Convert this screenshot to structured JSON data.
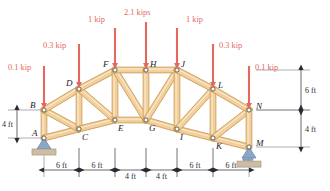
{
  "diagram": {
    "colors": {
      "member_fill": "#f2cf9b",
      "member_edge": "#c99a52",
      "load_red": "#e4685f",
      "dim_gray": "#2a2a33",
      "support_blue": "#8aa6c8",
      "support_ground": "#cdbda4"
    },
    "joints": [
      {
        "id": "A",
        "label": "A",
        "x": 44,
        "y": 138,
        "lx": 32,
        "ly": 136
      },
      {
        "id": "B",
        "label": "B",
        "x": 44,
        "y": 110,
        "lx": 30,
        "ly": 108
      },
      {
        "id": "C",
        "label": "C",
        "x": 79,
        "y": 129,
        "lx": 82,
        "ly": 140
      },
      {
        "id": "D",
        "label": "D",
        "x": 79,
        "y": 89,
        "lx": 66,
        "ly": 86
      },
      {
        "id": "E",
        "label": "E",
        "x": 115,
        "y": 120,
        "lx": 118,
        "ly": 131
      },
      {
        "id": "F",
        "label": "F",
        "x": 115,
        "y": 70,
        "lx": 103,
        "ly": 67
      },
      {
        "id": "G",
        "label": "G",
        "x": 146,
        "y": 120,
        "lx": 149,
        "ly": 131
      },
      {
        "id": "H",
        "label": "H",
        "x": 146,
        "y": 70,
        "lx": 150,
        "ly": 67
      },
      {
        "id": "I",
        "label": "I",
        "x": 177,
        "y": 129,
        "lx": 180,
        "ly": 140
      },
      {
        "id": "J",
        "label": "J",
        "x": 177,
        "y": 70,
        "lx": 181,
        "ly": 67
      },
      {
        "id": "K",
        "label": "K",
        "x": 213,
        "y": 138,
        "lx": 216,
        "ly": 149
      },
      {
        "id": "L",
        "label": "L",
        "x": 213,
        "y": 89,
        "lx": 218,
        "ly": 88
      },
      {
        "id": "M",
        "label": "M",
        "x": 249,
        "y": 147,
        "lx": 256,
        "ly": 146
      },
      {
        "id": "N",
        "label": "N",
        "x": 249,
        "y": 110,
        "lx": 256,
        "ly": 109
      }
    ],
    "members": [
      [
        "A",
        "B"
      ],
      [
        "A",
        "C"
      ],
      [
        "B",
        "C"
      ],
      [
        "B",
        "D"
      ],
      [
        "C",
        "D"
      ],
      [
        "C",
        "E"
      ],
      [
        "D",
        "E"
      ],
      [
        "D",
        "F"
      ],
      [
        "E",
        "F"
      ],
      [
        "E",
        "G"
      ],
      [
        "F",
        "G"
      ],
      [
        "F",
        "H"
      ],
      [
        "G",
        "H"
      ],
      [
        "G",
        "I"
      ],
      [
        "G",
        "J"
      ],
      [
        "H",
        "J"
      ],
      [
        "I",
        "J"
      ],
      [
        "I",
        "K"
      ],
      [
        "I",
        "L"
      ],
      [
        "J",
        "L"
      ],
      [
        "K",
        "L"
      ],
      [
        "K",
        "M"
      ],
      [
        "K",
        "N"
      ],
      [
        "L",
        "N"
      ],
      [
        "M",
        "N"
      ]
    ],
    "loads": [
      {
        "joint": "B",
        "magnitude": "0.1 kip",
        "x": 44,
        "tail_y": 66,
        "head_y": 106,
        "tx": 8,
        "ty": 70
      },
      {
        "joint": "D",
        "magnitude": "0.3 kip",
        "x": 79,
        "tail_y": 44,
        "head_y": 85,
        "tx": 43,
        "ty": 48
      },
      {
        "joint": "F",
        "magnitude": "1 kip",
        "x": 115,
        "tail_y": 28,
        "head_y": 66,
        "tx": 88,
        "ty": 22
      },
      {
        "joint": "H",
        "magnitude": "2.1 kips",
        "x": 146,
        "tail_y": 22,
        "head_y": 66,
        "tx": 124,
        "ty": 15
      },
      {
        "joint": "J",
        "magnitude": "1 kip",
        "x": 177,
        "tail_y": 28,
        "head_y": 66,
        "tx": 186,
        "ty": 22
      },
      {
        "joint": "L",
        "magnitude": "0.3 kip",
        "x": 213,
        "tail_y": 44,
        "head_y": 85,
        "tx": 219,
        "ty": 48
      },
      {
        "joint": "N",
        "magnitude": "0.1 kip",
        "x": 249,
        "tail_y": 66,
        "head_y": 106,
        "tx": 255,
        "ty": 70
      }
    ],
    "supports": [
      {
        "joint": "A",
        "type": "pin",
        "x": 44,
        "y": 138
      },
      {
        "joint": "M",
        "type": "roller",
        "x": 249,
        "y": 147
      }
    ],
    "bottom_dimensions": [
      {
        "label": "6 ft",
        "x1": 44,
        "x2": 79
      },
      {
        "label": "6 ft",
        "x1": 79,
        "x2": 115
      },
      {
        "label": "4 ft",
        "x1": 115,
        "x2": 146
      },
      {
        "label": "4 ft",
        "x1": 146,
        "x2": 177
      },
      {
        "label": "6 ft",
        "x1": 177,
        "x2": 213
      },
      {
        "label": "6 ft",
        "x1": 213,
        "x2": 249
      }
    ],
    "bottom_dimension_y": 170,
    "left_dimensions": [
      {
        "label": "4 ft",
        "y1": 110,
        "y2": 138,
        "x": 17
      }
    ],
    "right_dimensions": [
      {
        "label": "6 ft",
        "y1": 70,
        "y2": 110,
        "x": 301
      },
      {
        "label": "4 ft",
        "y1": 110,
        "y2": 147,
        "x": 301
      }
    ]
  }
}
